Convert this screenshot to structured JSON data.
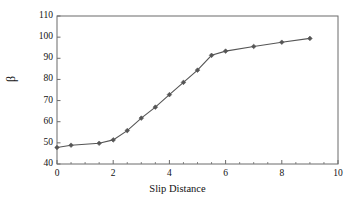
{
  "chart_data": {
    "type": "line",
    "title": "",
    "subtitle": "",
    "xlabel": "Slip Distance",
    "ylabel": "β",
    "xlim": [
      0,
      10
    ],
    "ylim": [
      40,
      110
    ],
    "xticks": [
      0,
      2,
      4,
      6,
      8,
      10
    ],
    "xtick_labels": [
      "0",
      "2",
      "4",
      "6",
      "8",
      "10"
    ],
    "yticks": [
      40,
      50,
      60,
      70,
      80,
      90,
      100,
      110
    ],
    "ytick_labels": [
      "40",
      "50",
      "60",
      "70",
      "80",
      "90",
      "100",
      "110"
    ],
    "x_minor_tick_step": 0.5,
    "grid": false,
    "legend": false,
    "legend_position": "none",
    "marker": "diamond",
    "line_color": "#555555",
    "marker_color": "#555555",
    "axis_color": "#6b6b6b",
    "background_color": "#ffffff",
    "series": [
      {
        "name": "beta",
        "x": [
          0,
          0.5,
          1.5,
          2,
          2.5,
          3,
          3.5,
          4,
          4.5,
          5,
          5.5,
          6,
          7,
          8,
          9
        ],
        "values": [
          47.8,
          48.9,
          49.8,
          51.4,
          55.8,
          61.7,
          66.9,
          72.8,
          78.6,
          84.4,
          91.4,
          93.4,
          95.6,
          97.6,
          99.4
        ]
      }
    ]
  },
  "axes": {
    "x_title": "Slip Distance",
    "y_title": "β"
  }
}
